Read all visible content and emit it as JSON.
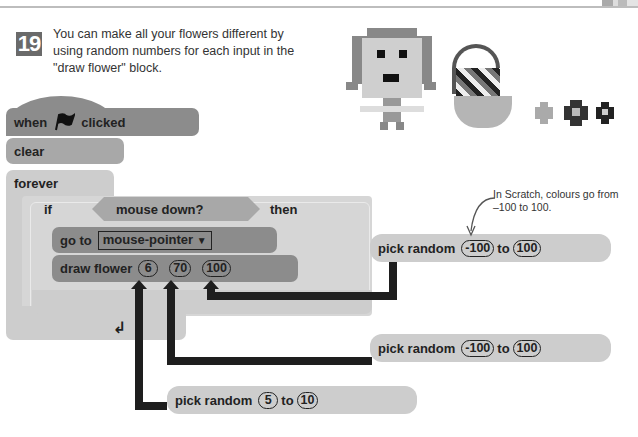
{
  "page": {
    "step_number": "19",
    "instruction": "You can make all your flowers different by using random numbers for each input in the \"draw flower\" block."
  },
  "script": {
    "hat": {
      "before": "when",
      "icon": "green-flag-icon",
      "after": "clicked"
    },
    "clear": "clear",
    "forever": "forever",
    "if": {
      "label": "if",
      "condition": "mouse down?",
      "then": "then"
    },
    "goto": {
      "label": "go to",
      "target": "mouse-pointer",
      "dropdown_icon": "▼"
    },
    "draw_flower": {
      "label": "draw flower",
      "inputs": [
        "6",
        "70",
        "100"
      ]
    },
    "loop_icon": "↲"
  },
  "random_blocks": [
    {
      "label": "pick random",
      "from": "-100",
      "to_label": "to",
      "to": "100",
      "feeds": "100"
    },
    {
      "label": "pick random",
      "from": "-100",
      "to_label": "to",
      "to": "100",
      "feeds": "70"
    },
    {
      "label": "pick random",
      "from": "5",
      "to_label": "to",
      "to": "10",
      "feeds": "6"
    }
  ],
  "annotation": {
    "text": "In Scratch, colours go from –100 to 100."
  },
  "colors": {
    "events": "#8c8c8c",
    "pen": "#a8a8a8",
    "control": "#cdcdcd",
    "wire": "#1e1e1e"
  }
}
